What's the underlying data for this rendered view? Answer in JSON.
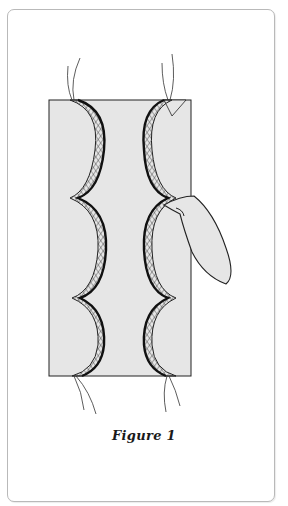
{
  "figure": {
    "caption": "Figure 1"
  },
  "colors": {
    "fill": "#e6e6e6",
    "outline": "#222222",
    "card_border": "#b9b9b9"
  }
}
